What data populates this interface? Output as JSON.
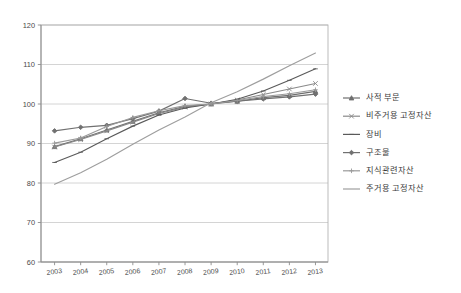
{
  "chart_data": {
    "type": "line",
    "title": "",
    "subtitle": "",
    "xlabel": "",
    "ylabel": "",
    "x": [
      "2003",
      "2004",
      "2005",
      "2006",
      "2007",
      "2008",
      "2009",
      "2010",
      "2011",
      "2012",
      "2013"
    ],
    "categories": [
      "2003",
      "2004",
      "2005",
      "2006",
      "2007",
      "2008",
      "2009",
      "2010",
      "2011",
      "2012",
      "2013"
    ],
    "ylim": [
      60,
      120
    ],
    "ytick_labels": [
      "60",
      "70",
      "80",
      "90",
      "100",
      "110",
      "120"
    ],
    "yticks": [
      60,
      70,
      80,
      90,
      100,
      110,
      120
    ],
    "grid": true,
    "grid_axis": "y",
    "legend_position": "right",
    "index_base_year": "2009",
    "index_base_value": 100,
    "series": [
      {
        "name": "사적 부문",
        "color": "#6e6e6e",
        "marker": "triangle",
        "values": [
          89.2,
          91.2,
          93.4,
          95.6,
          97.8,
          99.4,
          100.0,
          100.7,
          101.6,
          102.2,
          103.2
        ]
      },
      {
        "name": "비주거용 고정자산",
        "color": "#8a8a8a",
        "marker": "cross",
        "values": [
          89.1,
          91.0,
          93.2,
          95.4,
          97.6,
          99.2,
          100.0,
          101.0,
          102.4,
          103.8,
          105.2
        ]
      },
      {
        "name": "장비",
        "color": "#5a5a5a",
        "marker": "dash",
        "values": [
          85.2,
          87.8,
          91.2,
          94.4,
          97.2,
          99.0,
          100.0,
          101.2,
          103.3,
          106.0,
          108.9
        ]
      },
      {
        "name": "구조물",
        "color": "#707070",
        "marker": "diamond",
        "values": [
          93.2,
          94.1,
          94.6,
          96.3,
          98.2,
          101.4,
          100.2,
          100.7,
          101.3,
          101.8,
          102.5
        ]
      },
      {
        "name": "지식관련자산",
        "color": "#9a9a9a",
        "marker": "plus",
        "values": [
          90.1,
          91.4,
          94.3,
          96.6,
          98.3,
          99.6,
          100.0,
          100.9,
          101.9,
          102.6,
          103.6
        ]
      },
      {
        "name": "주거용 고정자산",
        "color": "#9e9e9e",
        "marker": "none",
        "values": [
          79.7,
          82.6,
          86.0,
          89.8,
          93.4,
          96.7,
          100.3,
          103.1,
          106.3,
          109.7,
          112.9
        ]
      }
    ]
  }
}
